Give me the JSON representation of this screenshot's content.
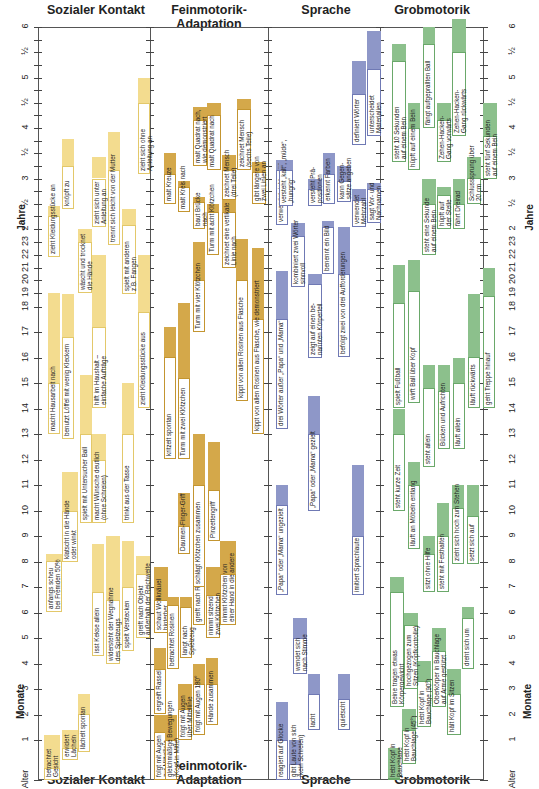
{
  "chart_data": {
    "type": "table",
    "xlabel": "",
    "ylabel_months": "Monate",
    "ylabel_years": "Jahre",
    "y_ticks_left": [
      "Alter",
      "1",
      "2",
      "3",
      "4",
      "5",
      "6",
      "7",
      "8",
      "9",
      "10",
      "11",
      "12",
      "13",
      "14",
      "15",
      "16",
      "17",
      "18",
      "19",
      "20",
      "21",
      "22",
      "23",
      "2",
      "½",
      "3",
      "½",
      "4",
      "½",
      "5",
      "½",
      "6"
    ],
    "grid": false,
    "columns": [
      {
        "name": "Sozialer Kontakt",
        "color": "#f3dc8f",
        "box_border": "#e3c86a"
      },
      {
        "name": "Feinmotorik-Adaptation",
        "color": "#d4a84a",
        "box_border": "#c39530"
      },
      {
        "name": "Sprache",
        "color": "#8e97c8",
        "box_border": "#6f79b4"
      },
      {
        "name": "Grobmotorik",
        "color": "#8cc08c",
        "box_border": "#6aa86a"
      }
    ],
    "note": "Each milestone: start month (bottom of white box), 50% point (top of white box), 90% point (top of colored bar). Values in months."
  },
  "header": {
    "col1": "Sozialer Kontakt",
    "col2": "Feinmotorik-Adaptation",
    "col3": "Sprache",
    "col4": "Grobmotorik"
  },
  "axis": {
    "alter": "Alter",
    "monate": "Monate",
    "jahre": "Jahre",
    "month_ticks": [
      "1",
      "2",
      "3",
      "4",
      "5",
      "6",
      "7",
      "8",
      "9",
      "10",
      "11",
      "12",
      "13",
      "14",
      "15",
      "16",
      "17",
      "18",
      "19",
      "20",
      "21",
      "22",
      "23"
    ],
    "year_ticks": [
      "2",
      "½",
      "3",
      "½",
      "4",
      "½",
      "5",
      "½",
      "6"
    ]
  },
  "milestones": {
    "sozial": [
      {
        "label": "betrachtet\nGesicht",
        "x": 44,
        "w": 16,
        "start": 0,
        "mid": 0.3,
        "end": 1.2
      },
      {
        "label": "erwidert\nLächeln",
        "x": 62,
        "w": 16,
        "start": 0.5,
        "mid": 0.8,
        "end": 1.4
      },
      {
        "label": "lächelt spontan",
        "x": 78,
        "w": 12,
        "start": 0.7,
        "mid": 2.0,
        "end": 2.8
      },
      {
        "label": "anfangs scheu\nbei Fremden 50%",
        "x": 46,
        "w": 16,
        "start": 6.0,
        "mid": 8.0,
        "end": 8.3
      },
      {
        "label": "klatscht in die Hände\noder winkt",
        "x": 62,
        "w": 16,
        "start": 8.0,
        "mid": 10.0,
        "end": 11.5
      },
      {
        "label": "isst Kekse allein",
        "x": 92,
        "w": 12,
        "start": 4.3,
        "mid": 6.8,
        "end": 8.7
      },
      {
        "label": "widersteht der Wegnahme\ndes Spielzeugs",
        "x": 106,
        "w": 14,
        "start": 4.0,
        "mid": 6.5,
        "end": 9.0
      },
      {
        "label": "spielt Verstecken",
        "x": 122,
        "w": 12,
        "start": 4.5,
        "mid": 7.0,
        "end": 8.8
      },
      {
        "label": "greift nach Objekt\naußerhalb der Reichweite",
        "x": 136,
        "w": 14,
        "start": 5.0,
        "mid": 7.5,
        "end": 8.2
      },
      {
        "label": "spielt mit Untersucher Ball",
        "x": 80,
        "w": 12,
        "start": 9.5,
        "mid": 13.0,
        "end": 15.3
      },
      {
        "label": "macht Wünsche deutlich\n(ohne Schreien)",
        "x": 92,
        "w": 14,
        "start": 9.5,
        "mid": 12.0,
        "end": 13.0
      },
      {
        "label": "trinkt aus der Tasse",
        "x": 122,
        "w": 12,
        "start": 9.5,
        "mid": 13.0,
        "end": 15.0
      },
      {
        "label": "macht Hausarbeit nach",
        "x": 48,
        "w": 12,
        "start": 13.0,
        "mid": 15.0,
        "end": 19.0
      },
      {
        "label": "benutzt Löffel mit wenig Kleckern",
        "x": 62,
        "w": 12,
        "start": 12.8,
        "mid": 16.8,
        "end": 18.9
      },
      {
        "label": "hilft im Haushalt –\neinfache Aufträge",
        "x": 92,
        "w": 14,
        "start": 14.0,
        "mid": 17.2,
        "end": 22.0
      },
      {
        "label": "zieht Kleidungsstücke aus",
        "x": 138,
        "w": 12,
        "start": 14.0,
        "mid": 17.8,
        "end": 22.0
      },
      {
        "label": "wäscht und trocknet\ndie Hände",
        "x": 78,
        "w": 14,
        "start": 19.0,
        "mid": 23.0,
        "end": 24.0
      },
      {
        "label": "zieht Kleidungsstücke an",
        "x": 48,
        "w": 12,
        "start": 21.8,
        "mid": 27.0,
        "end": 29.5
      },
      {
        "label": "knöpft zu",
        "x": 62,
        "w": 12,
        "start": 28.7,
        "mid": 39.0,
        "end": 45.5
      },
      {
        "label": "zieht sich unter\nAnleitung an",
        "x": 92,
        "w": 14,
        "start": 24.5,
        "mid": 36.0,
        "end": 41.0
      },
      {
        "label": "trennt sich leicht von der Mutter",
        "x": 108,
        "w": 12,
        "start": 22.8,
        "mid": 38.0,
        "end": 47.0
      },
      {
        "label": "spielt mit anderen\nz.B. Fangen",
        "x": 122,
        "w": 14,
        "start": 18.9,
        "mid": 25.0,
        "end": 28.7
      },
      {
        "label": "zieht sich ohne\nAnleitung an",
        "x": 138,
        "w": 12,
        "start": 37.0,
        "mid": 54.0,
        "end": 60.0
      }
    ],
    "fein": [
      {
        "label": "folgt mit Augen\nzur Mittellinie",
        "x": 154,
        "w": 12,
        "start": 0,
        "mid": 1.3,
        "end": 2.0
      },
      {
        "label": "gleichmäßige Bewegungen\n(Kopf in Mitte)",
        "x": 165,
        "w": 12,
        "start": 0,
        "mid": 1.0,
        "end": 2.0
      },
      {
        "label": "folgt mit Augen\nüber Mittellinie",
        "x": 178,
        "w": 14,
        "start": 1.0,
        "mid": 2.2,
        "end": 3.2
      },
      {
        "label": "folgt mit Augen 180°",
        "x": 193,
        "w": 12,
        "start": 1.2,
        "mid": 3.2,
        "end": 4.0
      },
      {
        "label": "Hände zusammen",
        "x": 206,
        "w": 12,
        "start": 1.6,
        "mid": 3.2,
        "end": 4.2
      },
      {
        "label": "ergreift Rassel",
        "x": 154,
        "w": 12,
        "start": 2.0,
        "mid": 3.8,
        "end": 4.6
      },
      {
        "label": "schaut Wollknäuel\nhinterher",
        "x": 154,
        "w": 14,
        "start": 5.2,
        "mid": 6.5,
        "end": 7.8
      },
      {
        "label": "betrachtet Rosinen",
        "x": 167,
        "w": 12,
        "start": 3.8,
        "mid": 6.3,
        "end": 6.6
      },
      {
        "label": "langt nach\nSpielzeug",
        "x": 180,
        "w": 12,
        "start": 4.2,
        "mid": 6.2,
        "end": 6.6
      },
      {
        "label": "greift nach Rosine",
        "x": 193,
        "w": 12,
        "start": 5.5,
        "mid": 7.5,
        "end": 8.4
      },
      {
        "label": "nimmt sitzend\nzwei Klötzchen",
        "x": 206,
        "w": 14,
        "start": 5.0,
        "mid": 6.7,
        "end": 7.8
      },
      {
        "label": "nimmt Klötzchen von\neiner Hand in die andere",
        "x": 220,
        "w": 16,
        "start": 5.5,
        "mid": 7.5,
        "end": 8.8
      },
      {
        "label": "Daumen-Finger-Griff",
        "x": 178,
        "w": 12,
        "start": 8.3,
        "mid": 9.4,
        "end": 10.7
      },
      {
        "label": "schlägt Klötzchen zusammen",
        "x": 193,
        "w": 12,
        "start": 7.0,
        "mid": 11.0,
        "end": 13.0
      },
      {
        "label": "Pinzettengriff",
        "x": 208,
        "w": 12,
        "start": 8.8,
        "mid": 10.8,
        "end": 12.7
      },
      {
        "label": "kritzelt spontan",
        "x": 164,
        "w": 12,
        "start": 12.0,
        "mid": 16.0,
        "end": 17.2
      },
      {
        "label": "Turm mit zwei Klötzchen",
        "x": 178,
        "w": 12,
        "start": 12.0,
        "mid": 15.2,
        "end": 18.2
      },
      {
        "label": "Turm mit vier Klötzchen",
        "x": 193,
        "w": 12,
        "start": 17.0,
        "mid": 20.0,
        "end": 23.0
      },
      {
        "label": "kippt von allen Rosinen aus Flasche",
        "x": 236,
        "w": 12,
        "start": 14.3,
        "mid": 20.0,
        "end": 23.2
      },
      {
        "label": "kippt von allen Rosinen aus Flasche, wie demonstriert",
        "x": 252,
        "w": 12,
        "start": 13.0,
        "mid": 17.5,
        "end": 22.5
      },
      {
        "label": "malt Kreuze",
        "x": 164,
        "w": 12,
        "start": 30.0,
        "mid": 37.0,
        "end": 42.0
      },
      {
        "label": "malt Kreis nach",
        "x": 178,
        "w": 12,
        "start": 28.0,
        "mid": 34.0,
        "end": 35.5
      },
      {
        "label": "baut Brücke\nnach",
        "x": 193,
        "w": 12,
        "start": 24.0,
        "mid": 30.5,
        "end": 31.5
      },
      {
        "label": "Turm mit acht Klötzchen",
        "x": 207,
        "w": 12,
        "start": 22.0,
        "mid": 28.0,
        "end": 30.0
      },
      {
        "label": "zeichnet eine vertikale\nLinie nach",
        "x": 222,
        "w": 14,
        "start": 21.0,
        "mid": 28.0,
        "end": 31.0
      },
      {
        "label": "malt Quadrat nach,\nwie demonstriert",
        "x": 193,
        "w": 14,
        "start": 39.0,
        "mid": 50.0,
        "end": 53.0
      },
      {
        "label": "malt Quadrat nach",
        "x": 207,
        "w": 14,
        "start": 38.0,
        "mid": 51.0,
        "end": 54.0
      },
      {
        "label": "zeichnet Mensch\n(drei Teile)",
        "x": 222,
        "w": 14,
        "start": 31.0,
        "mid": 38.0,
        "end": 41.5
      },
      {
        "label": "zeichnet Mensch\n(sechs Teile)",
        "x": 237,
        "w": 14,
        "start": 38.0,
        "mid": 52.5,
        "end": 55.0
      },
      {
        "label": "gibt längere von\nzwei Linien an",
        "x": 252,
        "w": 14,
        "start": 30.0,
        "mid": 37.5,
        "end": 40.0
      }
    ],
    "sprache": [
      {
        "label": "reagiert auf Glocke",
        "x": 276,
        "w": 12,
        "start": 0,
        "mid": 1.0,
        "end": 2.5
      },
      {
        "label": "gibt Laute von sich\n(kein Schreien)",
        "x": 289,
        "w": 12,
        "start": 0,
        "mid": 0.4,
        "end": 1.0
      },
      {
        "label": "wendet sich\nnach Stimme",
        "x": 293,
        "w": 14,
        "start": 3.6,
        "mid": 5.0,
        "end": 5.8
      },
      {
        "label": "lacht",
        "x": 308,
        "w": 12,
        "start": 1.4,
        "mid": 2.8,
        "end": 3.6
      },
      {
        "label": "quietscht",
        "x": 338,
        "w": 12,
        "start": 1.4,
        "mid": 2.6,
        "end": 3.6
      },
      {
        "label": "„Papa“ oder „Mama“ ungezielt",
        "x": 276,
        "w": 12,
        "start": 6.7,
        "mid": 10.2,
        "end": 11.0
      },
      {
        "label": "imitiert Sprachlaute",
        "x": 352,
        "w": 12,
        "start": 6.7,
        "mid": 9.0,
        "end": 11.8
      },
      {
        "label": "„Papa“ oder „Mama“ gezielt",
        "x": 308,
        "w": 12,
        "start": 10.0,
        "mid": 13.0,
        "end": 14.5
      },
      {
        "label": "drei Wörter außer „Papa“ und „Mama“",
        "x": 276,
        "w": 12,
        "start": 13.2,
        "mid": 17.5,
        "end": 20.7
      },
      {
        "label": "zeigt auf einen be-\nnannten Körperteil",
        "x": 308,
        "w": 14,
        "start": 16.0,
        "mid": 19.7,
        "end": 20.5
      },
      {
        "label": "kombiniert zwei Wörter\nsinnvoll",
        "x": 291,
        "w": 14,
        "start": 19.5,
        "mid": 23.5,
        "end": 25.5
      },
      {
        "label": "befolgt zwei von drei Aufforderungen",
        "x": 338,
        "w": 12,
        "start": 16.0,
        "mid": 20.5,
        "end": 24.5
      },
      {
        "label": "benennt ein Bild",
        "x": 322,
        "w": 12,
        "start": 20.5,
        "mid": 24.5,
        "end": 26.0
      },
      {
        "label": "verwendet „ich“, „wir“",
        "x": 276,
        "w": 12,
        "start": 25.0,
        "mid": 38.0,
        "end": 40.5
      },
      {
        "label": "versteht „kalt“, „müde“,\n„hungrig“",
        "x": 279,
        "w": 14,
        "start": 29.5,
        "mid": 38.0,
        "end": 40.5
      },
      {
        "label": "versteht Prä-\npositionen",
        "x": 308,
        "w": 14,
        "start": 29.5,
        "mid": 33.5,
        "end": 36.0
      },
      {
        "label": "erkennt Farben",
        "x": 323,
        "w": 12,
        "start": 30.0,
        "mid": 37.0,
        "end": 42.0
      },
      {
        "label": "kann Gegen-\nsätze angeben",
        "x": 337,
        "w": 14,
        "start": 30.5,
        "mid": 35.5,
        "end": 39.0
      },
      {
        "label": "verwendet\nMehrzahl",
        "x": 352,
        "w": 14,
        "start": 24.5,
        "mid": 31.0,
        "end": 33.5
      },
      {
        "label": "sagt Vor- und\nNachnamen",
        "x": 367,
        "w": 14,
        "start": 25.5,
        "mid": 33.5,
        "end": 35.0
      },
      {
        "label": "definiert Wörter",
        "x": 352,
        "w": 14,
        "start": 44.0,
        "mid": 56.0,
        "end": 64.0
      },
      {
        "label": "unterscheidet\nMaterialien",
        "x": 367,
        "w": 14,
        "start": 46.0,
        "mid": 62.0,
        "end": 71.0
      }
    ],
    "grob": [
      {
        "label": "hebt Kopf in\nBauchlage",
        "x": 388,
        "w": 12,
        "start": 0,
        "mid": 0,
        "end": 0.8
      },
      {
        "label": "hebt Kopf in\nBauchlage (45°)",
        "x": 402,
        "w": 14,
        "start": 0.4,
        "mid": 1.4,
        "end": 2.2
      },
      {
        "label": "hebt Kopf in\nBauchlage (90°)",
        "x": 417,
        "w": 14,
        "start": 1.5,
        "mid": 3.3,
        "end": 4.1
      },
      {
        "label": "Oberkörper in Bauchlage\nauf Arme gestützt",
        "x": 432,
        "w": 14,
        "start": 2.3,
        "mid": 4.5,
        "end": 5.4
      },
      {
        "label": "hält Kopf im Sitzen",
        "x": 447,
        "w": 14,
        "start": 1.2,
        "mid": 2.8,
        "end": 3.8
      },
      {
        "label": "Beine tragen etwas\nKörpergewicht",
        "x": 390,
        "w": 14,
        "start": 2.3,
        "mid": 6.8,
        "end": 7.4
      },
      {
        "label": "hochgezogen zum\nSitzen (Kopfkontrolle)",
        "x": 404,
        "w": 14,
        "start": 3.0,
        "mid": 5.5,
        "end": 6.0
      },
      {
        "label": "dreht sich um",
        "x": 462,
        "w": 12,
        "start": 3.8,
        "mid": 5.8,
        "end": 6.2
      },
      {
        "label": "sitzt ohne Hilfe",
        "x": 423,
        "w": 12,
        "start": 6.8,
        "mid": 8.3,
        "end": 9.0
      },
      {
        "label": "steht mit Festhalten",
        "x": 437,
        "w": 12,
        "start": 6.8,
        "mid": 9.0,
        "end": 10.3
      },
      {
        "label": "zieht sich hoch zum Stehen",
        "x": 452,
        "w": 12,
        "start": 7.9,
        "mid": 10.1,
        "end": 11.0
      },
      {
        "label": "setzt sich auf",
        "x": 467,
        "w": 12,
        "start": 7.9,
        "mid": 9.8,
        "end": 11.0
      },
      {
        "label": "steht kurze Zeit",
        "x": 393,
        "w": 12,
        "start": 10.0,
        "mid": 13.0,
        "end": 14.0
      },
      {
        "label": "läuft an Möbeln entlang",
        "x": 408,
        "w": 12,
        "start": 8.5,
        "mid": 11.0,
        "end": 11.9
      },
      {
        "label": "steht allein",
        "x": 423,
        "w": 12,
        "start": 11.7,
        "mid": 14.8,
        "end": 15.7
      },
      {
        "label": "Bücken und Aufrichten",
        "x": 438,
        "w": 12,
        "start": 12.4,
        "mid": 14.7,
        "end": 15.7
      },
      {
        "label": "läuft allein",
        "x": 453,
        "w": 12,
        "start": 12.4,
        "mid": 15.0,
        "end": 16.0
      },
      {
        "label": "läuft rückwärts",
        "x": 468,
        "w": 12,
        "start": 14.0,
        "mid": 16.0,
        "end": 18.9
      },
      {
        "label": "geht Treppe hinauf",
        "x": 483,
        "w": 12,
        "start": 14.0,
        "mid": 18.8,
        "end": 21.0
      },
      {
        "label": "spielt Fußball",
        "x": 393,
        "w": 12,
        "start": 14.0,
        "mid": 18.2,
        "end": 21.2
      },
      {
        "label": "wirft Ball über Kopf",
        "x": 408,
        "w": 12,
        "start": 14.2,
        "mid": 19.2,
        "end": 21.6
      },
      {
        "label": "steht eine Sekunde\nauf einem Bein",
        "x": 422,
        "w": 14,
        "start": 22.0,
        "mid": 30.0,
        "end": 36.0
      },
      {
        "label": "hüpft auf\nder Stelle",
        "x": 437,
        "w": 14,
        "start": 24.0,
        "mid": 32.0,
        "end": 34.0
      },
      {
        "label": "fährt Dreirad",
        "x": 453,
        "w": 12,
        "start": 24.0,
        "mid": 30.0,
        "end": 36.0
      },
      {
        "label": "Schlusssprung über\n20 cm",
        "x": 467,
        "w": 14,
        "start": 30.0,
        "mid": 36.0,
        "end": 41.0
      },
      {
        "label": "steht fünf Sekunden\nauf einem Bein",
        "x": 483,
        "w": 14,
        "start": 36.0,
        "mid": 46.0,
        "end": 54.0
      },
      {
        "label": "steht 10 Sekunden\nauf einem Bein",
        "x": 392,
        "w": 14,
        "start": 40.0,
        "mid": 64.0,
        "end": 68.0
      },
      {
        "label": "hüpft auf einem Bein",
        "x": 408,
        "w": 12,
        "start": 38.0,
        "mid": 48.0,
        "end": 54.0
      },
      {
        "label": "fängt aufgeprallten Ball",
        "x": 423,
        "w": 12,
        "start": 48.0,
        "mid": 68.0,
        "end": 72.0
      },
      {
        "label": "Zehen-Hacken-\nGang vorwärts",
        "x": 437,
        "w": 14,
        "start": 40.0,
        "mid": 50.0,
        "end": 54.0
      },
      {
        "label": "Zehen-Hacken-\nGang rückwärts",
        "x": 452,
        "w": 14,
        "start": 46.0,
        "mid": 66.0,
        "end": 74.0
      }
    ]
  }
}
